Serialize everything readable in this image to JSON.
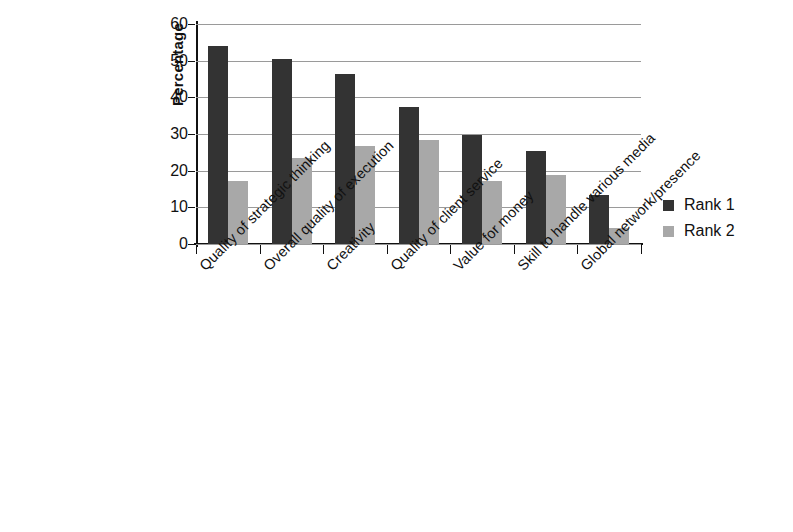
{
  "chart_data": {
    "type": "bar",
    "title": "",
    "xlabel": "",
    "ylabel": "Percentage",
    "ylim": [
      0,
      60
    ],
    "ytick_values": [
      0,
      10,
      20,
      30,
      40,
      50,
      60
    ],
    "ytick_labels": [
      "0",
      "10",
      "20",
      "30",
      "40",
      "50",
      "60"
    ],
    "grid": "horizontal",
    "legend_position": "right",
    "categories": [
      "Quality of strategic thinking",
      "Overall quality of execution",
      "Creativity",
      "Quality of client service",
      "Value for money",
      "Skill to handle various media",
      "Global network/presence"
    ],
    "series": [
      {
        "name": "Rank 1",
        "color": "#333333",
        "values": [
          54.0,
          50.5,
          46.5,
          37.5,
          29.8,
          25.5,
          13.5
        ]
      },
      {
        "name": "Rank 2",
        "color": "#a8a8a8",
        "values": [
          17.3,
          23.5,
          26.7,
          28.5,
          17.3,
          18.7,
          4.5
        ]
      }
    ]
  },
  "legend": {
    "items": [
      {
        "label": "Rank 1",
        "color": "#333333"
      },
      {
        "label": "Rank 2",
        "color": "#a8a8a8"
      }
    ]
  },
  "axis": {
    "y_title": "Percentage"
  }
}
